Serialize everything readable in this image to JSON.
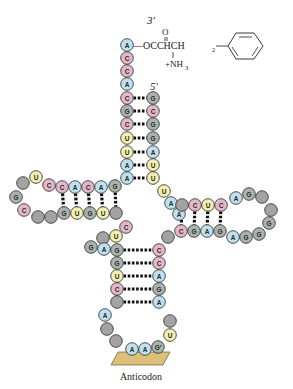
{
  "labels": {
    "three_prime": "3′",
    "five_prime": "5′",
    "anticodon": "Anticodon",
    "amino_acid_top": "O",
    "amino_acid_chain": "—OCCHCH",
    "amino_acid_sub": "2",
    "amino_acid_amine": "+NH",
    "amino_acid_amine_sub": "3"
  },
  "colors": {
    "A": "#bfe0ee",
    "C": "#e3b6c8",
    "G": "#a9b3ad",
    "U": "#f2efb0",
    "unmodified": "#a3a3a3",
    "pair_line": "#111111",
    "anticodon_platform": "#dcc07a"
  },
  "nucleotides": [
    {
      "b": "A",
      "x": 127,
      "y": 45
    },
    {
      "b": "C",
      "x": 127,
      "y": 58
    },
    {
      "b": "C",
      "x": 127,
      "y": 71
    },
    {
      "b": "A",
      "x": 127,
      "y": 84
    },
    {
      "b": "C",
      "x": 127,
      "y": 98
    },
    {
      "b": "G",
      "x": 127,
      "y": 111
    },
    {
      "b": "C",
      "x": 127,
      "y": 124
    },
    {
      "b": "U",
      "x": 127,
      "y": 138
    },
    {
      "b": "U",
      "x": 127,
      "y": 152
    },
    {
      "b": "A",
      "x": 127,
      "y": 165
    },
    {
      "b": "A",
      "x": 127,
      "y": 178
    },
    {
      "b": "G",
      "x": 153,
      "y": 98
    },
    {
      "b": "C",
      "x": 153,
      "y": 111
    },
    {
      "b": "G",
      "x": 153,
      "y": 124
    },
    {
      "b": "G",
      "x": 153,
      "y": 138
    },
    {
      "b": "A",
      "x": 153,
      "y": 152
    },
    {
      "b": "U",
      "x": 153,
      "y": 165
    },
    {
      "b": "U",
      "x": 153,
      "y": 178
    },
    {
      "b": "U",
      "x": 164,
      "y": 191
    },
    {
      "b": "A",
      "x": 171,
      "y": 203
    },
    {
      "b": "A",
      "x": 179,
      "y": 214
    },
    {
      "b": "G",
      "x": 115,
      "y": 186
    },
    {
      "b": "A",
      "x": 101,
      "y": 187
    },
    {
      "b": "C",
      "x": 88,
      "y": 187
    },
    {
      "b": "A",
      "x": 75,
      "y": 187
    },
    {
      "b": "C",
      "x": 62,
      "y": 187
    },
    {
      "b": "C",
      "x": 49,
      "y": 185
    },
    {
      "b": "U",
      "x": 36,
      "y": 177
    },
    {
      "b": "N",
      "x": 23,
      "y": 183
    },
    {
      "b": "G",
      "x": 16,
      "y": 197
    },
    {
      "b": "C",
      "x": 24,
      "y": 210
    },
    {
      "b": "N",
      "x": 38,
      "y": 217
    },
    {
      "b": "N",
      "x": 51,
      "y": 217
    },
    {
      "b": "G",
      "x": 64,
      "y": 213
    },
    {
      "b": "U",
      "x": 77,
      "y": 213
    },
    {
      "b": "G",
      "x": 90,
      "y": 213
    },
    {
      "b": "U",
      "x": 103,
      "y": 213
    },
    {
      "b": "N",
      "x": 116,
      "y": 213
    },
    {
      "b": "C",
      "x": 126,
      "y": 227
    },
    {
      "b": "U",
      "x": 116,
      "y": 236
    },
    {
      "b": "N",
      "x": 103,
      "y": 238
    },
    {
      "b": "G",
      "x": 91,
      "y": 247
    },
    {
      "b": "A",
      "x": 104,
      "y": 249
    },
    {
      "b": "G",
      "x": 117,
      "y": 250
    },
    {
      "b": "G",
      "x": 117,
      "y": 263
    },
    {
      "b": "U",
      "x": 117,
      "y": 276
    },
    {
      "b": "C",
      "x": 117,
      "y": 289
    },
    {
      "b": "N",
      "x": 117,
      "y": 302
    },
    {
      "b": "A",
      "x": 105,
      "y": 315
    },
    {
      "b": "N",
      "x": 107,
      "y": 329
    },
    {
      "b": "N",
      "x": 116,
      "y": 341
    },
    {
      "b": "A",
      "x": 132,
      "y": 349
    },
    {
      "b": "A",
      "x": 145,
      "y": 349
    },
    {
      "b": "G*",
      "x": 158,
      "y": 347
    },
    {
      "b": "U",
      "x": 170,
      "y": 335
    },
    {
      "b": "N",
      "x": 170,
      "y": 321
    },
    {
      "b": "A",
      "x": 159,
      "y": 302
    },
    {
      "b": "G",
      "x": 159,
      "y": 289
    },
    {
      "b": "A",
      "x": 159,
      "y": 276
    },
    {
      "b": "C",
      "x": 159,
      "y": 263
    },
    {
      "b": "C",
      "x": 159,
      "y": 250
    },
    {
      "b": "N",
      "x": 168,
      "y": 237
    },
    {
      "b": "C",
      "x": 181,
      "y": 231
    },
    {
      "b": "G",
      "x": 194,
      "y": 231
    },
    {
      "b": "A",
      "x": 207,
      "y": 231
    },
    {
      "b": "G",
      "x": 220,
      "y": 231
    },
    {
      "b": "A",
      "x": 233,
      "y": 237
    },
    {
      "b": "G",
      "x": 246,
      "y": 237
    },
    {
      "b": "G",
      "x": 259,
      "y": 234
    },
    {
      "b": "G",
      "x": 269,
      "y": 223
    },
    {
      "b": "N",
      "x": 271,
      "y": 210
    },
    {
      "b": "N",
      "x": 262,
      "y": 197
    },
    {
      "b": "G",
      "x": 249,
      "y": 194
    },
    {
      "b": "A",
      "x": 236,
      "y": 198
    },
    {
      "b": "C",
      "x": 221,
      "y": 205
    },
    {
      "b": "U",
      "x": 208,
      "y": 205
    },
    {
      "b": "C",
      "x": 195,
      "y": 205
    },
    {
      "b": "N",
      "x": 182,
      "y": 205
    }
  ],
  "pairs": [
    [
      127,
      98,
      153,
      98
    ],
    [
      127,
      111,
      153,
      111
    ],
    [
      127,
      124,
      153,
      124
    ],
    [
      127,
      138,
      153,
      138
    ],
    [
      127,
      152,
      153,
      152
    ],
    [
      127,
      165,
      153,
      165
    ],
    [
      127,
      178,
      153,
      178
    ],
    [
      62,
      187,
      64,
      213
    ],
    [
      75,
      187,
      77,
      213
    ],
    [
      88,
      187,
      90,
      213
    ],
    [
      101,
      187,
      103,
      213
    ],
    [
      115,
      186,
      116,
      213
    ],
    [
      117,
      250,
      159,
      250
    ],
    [
      117,
      263,
      159,
      263
    ],
    [
      117,
      276,
      159,
      276
    ],
    [
      117,
      289,
      159,
      289
    ],
    [
      117,
      302,
      159,
      302
    ],
    [
      182,
      205,
      181,
      231
    ],
    [
      195,
      205,
      194,
      231
    ],
    [
      208,
      205,
      207,
      231
    ],
    [
      221,
      205,
      220,
      231
    ]
  ]
}
